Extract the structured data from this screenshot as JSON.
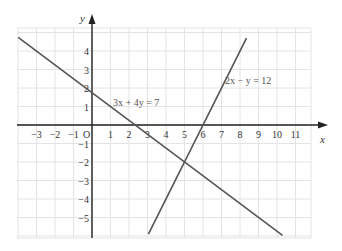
{
  "chart_data": {
    "type": "line",
    "title": "",
    "xlabel": "x",
    "ylabel": "y",
    "origin_label": "O",
    "xlim": [
      -4,
      12
    ],
    "ylim": [
      -6,
      5.5
    ],
    "grid": true,
    "x_ticks": [
      -3,
      -2,
      -1,
      1,
      2,
      3,
      4,
      5,
      6,
      7,
      8,
      9,
      10,
      11
    ],
    "x_tick_labels": [
      "−3",
      "−2",
      "−1",
      "1",
      "2",
      "3",
      "4",
      "5",
      "6",
      "7",
      "8",
      "9",
      "10",
      "11"
    ],
    "y_ticks": [
      4,
      3,
      2,
      1,
      -1,
      -2,
      -3,
      -4,
      -5
    ],
    "y_tick_labels": [
      "4",
      "3",
      "2",
      "1",
      "−1",
      "−2",
      "−3",
      "−4",
      "−5"
    ],
    "series": [
      {
        "name": "3x + 4y = 7",
        "label": "3x + 4y = 7",
        "equation": "3x + 4y = 7",
        "points": [
          [
            -3.99,
            4.74
          ],
          [
            10.3,
            -5.97
          ]
        ],
        "color": "#555555"
      },
      {
        "name": "2x − y = 12",
        "label": "2x − y = 12",
        "equation": "2x - y = 12",
        "points": [
          [
            3.05,
            -5.9
          ],
          [
            8.35,
            4.7
          ]
        ],
        "color": "#555555"
      }
    ],
    "intersection": [
      5,
      -2
    ],
    "legend": "none (inline labels)"
  },
  "style": {
    "grid_color": "#e4e4e4",
    "axis_color": "#222222",
    "line_color": "#555555"
  }
}
